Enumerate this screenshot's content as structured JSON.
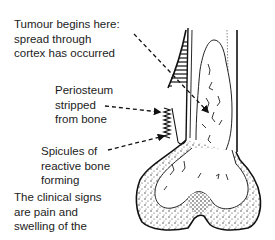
{
  "figure": {
    "labels": [
      {
        "id": "tumour-origin",
        "lines": [
          "Tumour begins here:",
          "spread through",
          "cortex has occurred"
        ]
      },
      {
        "id": "periosteum",
        "lines": [
          "Periosteum",
          "stripped",
          "from bone"
        ]
      },
      {
        "id": "spicules",
        "lines": [
          "Spicules of",
          "reactive bone",
          "forming"
        ]
      },
      {
        "id": "clinical-signs",
        "lines": [
          "The clinical signs",
          "are pain and",
          "swelling of the"
        ]
      }
    ]
  }
}
